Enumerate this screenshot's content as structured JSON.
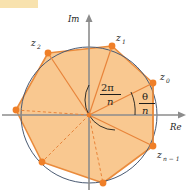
{
  "figure": {
    "axes": {
      "imaginary_label": "Im",
      "real_label": "Re"
    },
    "point_labels": [
      {
        "name": "z0",
        "base": "z",
        "sub": "0",
        "x": 160,
        "y": 80
      },
      {
        "name": "z1",
        "base": "z",
        "sub": "1",
        "x": 116,
        "y": 41
      },
      {
        "name": "z2",
        "base": "z",
        "sub": "2",
        "x": 32,
        "y": 46
      },
      {
        "name": "zn-1",
        "base": "z",
        "sub": "n − 1",
        "x": 158,
        "y": 156
      }
    ],
    "angle_annotations": [
      {
        "name": "central-angle",
        "numerator": "2π",
        "denominator": "n"
      },
      {
        "name": "offset-angle",
        "numerator": "θ",
        "denominator": "n"
      }
    ],
    "colors": {
      "polygon_fill": "#f9c890",
      "polygon_stroke": "#ea8b3c",
      "vertex_dot": "#ef7f28",
      "radius_solid": "#e8843a",
      "radius_dashed": "#e8843a",
      "circle_stroke": "#4a5a72",
      "axis_stroke": "#8c8c8c",
      "arc_stroke": "#1d1d1b",
      "corner_band": "#f8e2ae",
      "background": "#ffffff"
    },
    "geometry": {
      "center": {
        "x": 89,
        "y": 115
      },
      "circle_radius": 68,
      "vertices": [
        {
          "name": "z0",
          "x": 153,
          "y": 83,
          "radius_style": "solid"
        },
        {
          "name": "z1",
          "x": 112,
          "y": 46,
          "radius_style": "solid"
        },
        {
          "name": "z2",
          "x": 48,
          "y": 53,
          "radius_style": "solid"
        },
        {
          "name": "z3",
          "x": 16,
          "y": 110,
          "radius_style": "dashed"
        },
        {
          "name": "z4",
          "x": 42,
          "y": 162,
          "radius_style": "dashed"
        },
        {
          "name": "z5",
          "x": 103,
          "y": 183,
          "radius_style": "dashed"
        },
        {
          "name": "zn-1",
          "x": 153,
          "y": 146,
          "radius_style": "solid"
        }
      ]
    }
  }
}
